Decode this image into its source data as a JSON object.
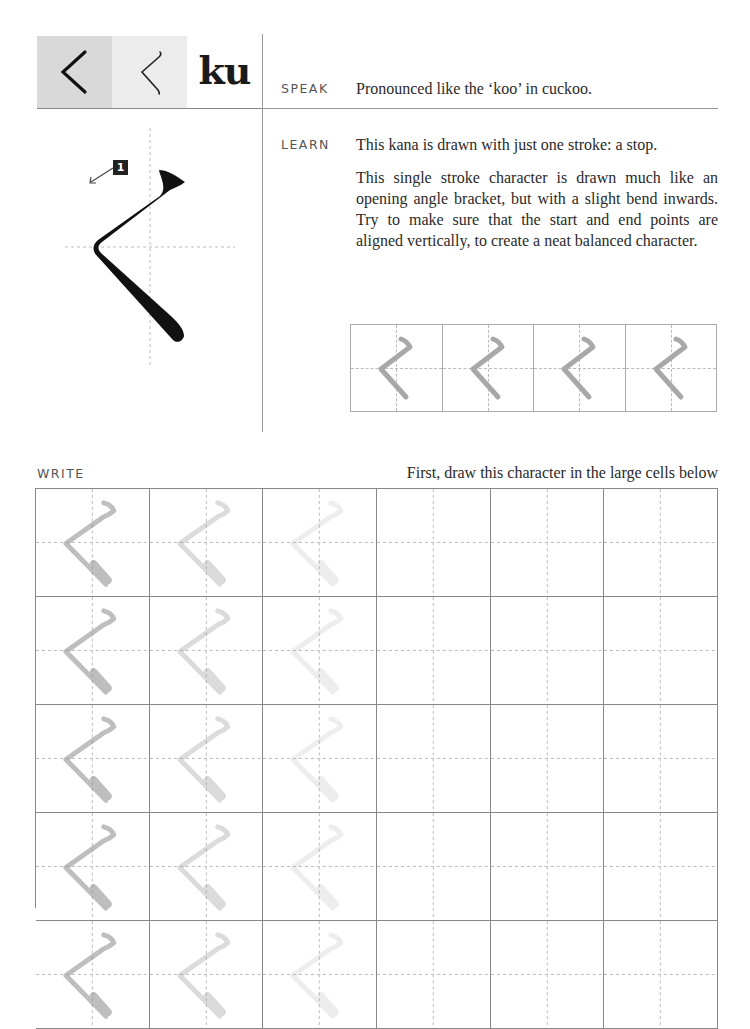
{
  "header": {
    "kana_hiragana_print": "く",
    "kana_hiragana_script": "く",
    "romaji": "ku",
    "block_colors": {
      "dark": "#d9d9d9",
      "light": "#ececec"
    }
  },
  "speak": {
    "label": "SPEAK",
    "text": "Pronounced like the ‘koo’ in cuckoo."
  },
  "learn": {
    "label": "LEARN",
    "paragraphs": [
      "This kana is drawn with just one stroke: a stop.",
      "This single stroke character  is drawn much like an opening angle bracket, but with a slight bend inwards. Try to make sure that the start and end points are aligned vertically, to create a neat balanced character."
    ]
  },
  "stroke_diagram": {
    "stroke_number": "1",
    "stroke_color": "#111111",
    "arrow_icon": "arrow-down-left-icon"
  },
  "practice_strip": {
    "cells": 4,
    "trace_color": "#a8a8a8"
  },
  "write": {
    "label": "WRITE",
    "instruction": "First, draw this character in the large cells below",
    "columns": 6,
    "visible_rows": 4,
    "trace_opacities": [
      0.55,
      0.3,
      0.15
    ],
    "trace_color": "#8a8a8a"
  }
}
